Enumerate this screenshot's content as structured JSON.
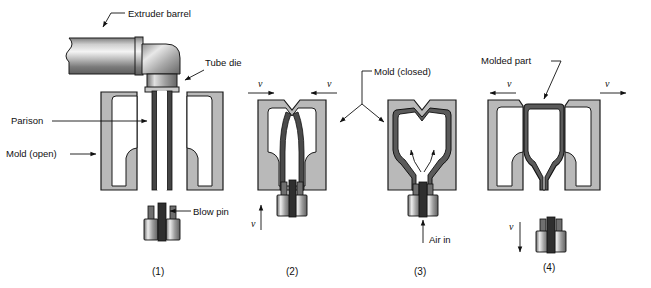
{
  "figure": {
    "colors": {
      "mold_fill": "#b9b9b9",
      "mold_stroke": "#1a1a1a",
      "cavity_fill": "#ffffff",
      "parison_fill": "#555555",
      "metal_light": "#f2f2f2",
      "metal_mid": "#9a9a9a",
      "metal_dark": "#5a5a5a",
      "label_color": "#111111",
      "background": "#ffffff"
    }
  },
  "labels": {
    "extruder_barrel": "Extruder barrel",
    "tube_die": "Tube die",
    "parison": "Parison",
    "mold_open": "Mold (open)",
    "blow_pin": "Blow pin",
    "mold_closed": "Mold (closed)",
    "air_in": "Air in",
    "molded_part": "Molded part",
    "velocity": "v"
  },
  "stages": [
    {
      "caption": "(1)",
      "name": "extrusion-of-parison"
    },
    {
      "caption": "(2)",
      "name": "mold-closing"
    },
    {
      "caption": "(3)",
      "name": "air-inflation"
    },
    {
      "caption": "(4)",
      "name": "mold-opening-part-removal"
    }
  ]
}
